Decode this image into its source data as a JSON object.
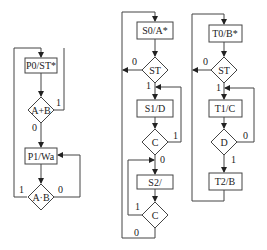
{
  "diagram": {
    "type": "ASM flowcharts",
    "charts": [
      {
        "id": "left",
        "nodes": [
          {
            "id": "p0",
            "kind": "state",
            "label": "P0/ST*"
          },
          {
            "id": "d1",
            "kind": "decision",
            "label": "A+B",
            "yes": "1",
            "no": "0"
          },
          {
            "id": "p1",
            "kind": "state",
            "label": "P1/Wa"
          },
          {
            "id": "d2",
            "kind": "decision",
            "label": "A·B",
            "yes": "1",
            "no": "0"
          }
        ]
      },
      {
        "id": "middle",
        "nodes": [
          {
            "id": "s0",
            "kind": "state",
            "label": "S0/A*"
          },
          {
            "id": "st",
            "kind": "decision",
            "label": "ST",
            "yes": "1",
            "no": "0"
          },
          {
            "id": "s1",
            "kind": "state",
            "label": "S1/D"
          },
          {
            "id": "c1",
            "kind": "decision",
            "label": "C",
            "yes": "1",
            "no": "0"
          },
          {
            "id": "s2",
            "kind": "state",
            "label": "S2/"
          },
          {
            "id": "c2",
            "kind": "decision",
            "label": "C",
            "yes": "1",
            "no": "0"
          }
        ]
      },
      {
        "id": "right",
        "nodes": [
          {
            "id": "t0",
            "kind": "state",
            "label": "T0/B*"
          },
          {
            "id": "st",
            "kind": "decision",
            "label": "ST",
            "yes": "1",
            "no": "0"
          },
          {
            "id": "t1",
            "kind": "state",
            "label": "T1/C"
          },
          {
            "id": "d",
            "kind": "decision",
            "label": "D",
            "yes": "1",
            "no": "0"
          },
          {
            "id": "t2",
            "kind": "state",
            "label": "T2/B"
          }
        ]
      }
    ]
  }
}
